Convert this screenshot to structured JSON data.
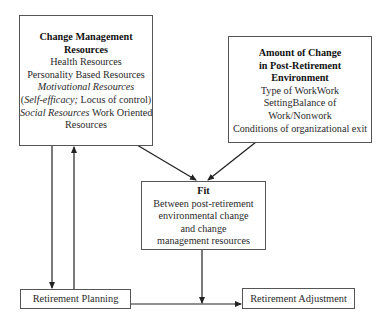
{
  "diagram": {
    "boxes": {
      "resources": {
        "title_lines": [
          "Change Management",
          "Resources"
        ],
        "items": {
          "health": "Health Resources",
          "personality": "Personality Based Resources",
          "motivational": "Motivational Resources",
          "self_efficacy": "Self-efficacy;",
          "locus": " Locus of control)",
          "open_paren": "(",
          "social": "Social Resources",
          "work_oriented_1": " Work Oriented",
          "work_oriented_2": "Resources"
        }
      },
      "change": {
        "title_lines": [
          "Amount of Change",
          "in Post-Retirement",
          "Environment"
        ],
        "items": [
          "Type of WorkWork",
          "SettingBalance of",
          "Work/Nonwork",
          "Conditions of organizational exit"
        ]
      },
      "fit": {
        "title": "Fit",
        "items": [
          "Between post-retirement",
          "environmental change",
          "and change",
          "management resources"
        ]
      },
      "planning": {
        "label": "Retirement Planning"
      },
      "adjustment": {
        "label": "Retirement Adjustment"
      }
    },
    "edges": [
      {
        "from": "Change Management Resources",
        "to": "Fit"
      },
      {
        "from": "Amount of Change in Post-Retirement Environment",
        "to": "Fit"
      },
      {
        "from": "Change Management Resources",
        "to": "Retirement Planning"
      },
      {
        "from": "Retirement Planning",
        "to": "Change Management Resources"
      },
      {
        "from": "Retirement Planning",
        "to": "Retirement Adjustment"
      },
      {
        "from": "Fit",
        "to": "Planning-Adjustment path (moderator)"
      }
    ],
    "colors": {
      "line": "#222222",
      "border": "#555555",
      "text": "#2a2a2a"
    }
  }
}
